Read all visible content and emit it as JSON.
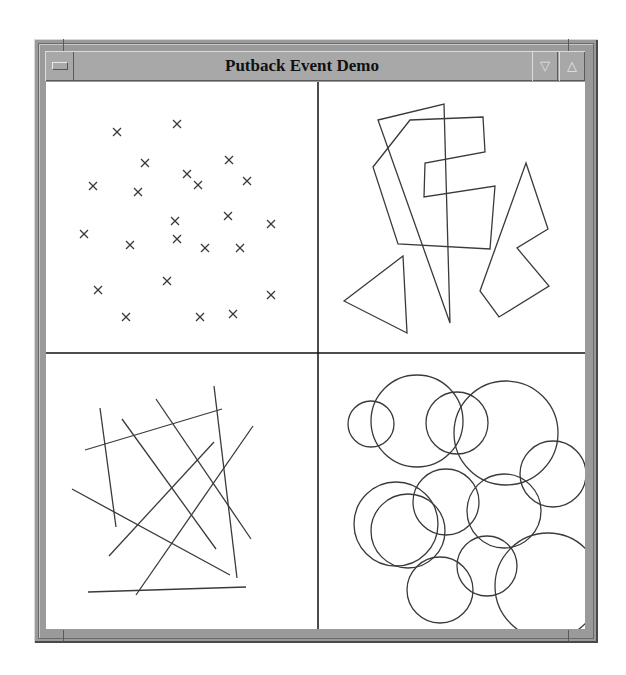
{
  "window": {
    "title": "Putback Event Demo",
    "menu_button": "window-menu",
    "minimize_glyph": "▽",
    "maximize_glyph": "△"
  },
  "panels": [
    {
      "name": "crosses",
      "marker": "x",
      "points": [
        [
          117,
          132
        ],
        [
          177,
          124
        ],
        [
          145,
          163
        ],
        [
          229,
          160
        ],
        [
          93,
          186
        ],
        [
          138,
          192
        ],
        [
          187,
          174
        ],
        [
          198,
          185
        ],
        [
          247,
          181
        ],
        [
          175,
          221
        ],
        [
          228,
          216
        ],
        [
          271,
          224
        ],
        [
          84,
          234
        ],
        [
          130,
          245
        ],
        [
          177,
          239
        ],
        [
          205,
          248
        ],
        [
          240,
          248
        ],
        [
          167,
          281
        ],
        [
          98,
          290
        ],
        [
          271,
          295
        ],
        [
          126,
          317
        ],
        [
          200,
          317
        ],
        [
          233,
          314
        ]
      ]
    },
    {
      "name": "polygons",
      "shapes": [
        [
          [
            378,
            120
          ],
          [
            444,
            104
          ],
          [
            450,
            323
          ]
        ],
        [
          [
            410,
            120
          ],
          [
            483,
            117
          ],
          [
            485,
            152
          ],
          [
            425,
            163
          ],
          [
            424,
            197
          ],
          [
            495,
            186
          ],
          [
            490,
            249
          ],
          [
            398,
            244
          ],
          [
            373,
            167
          ]
        ],
        [
          [
            344,
            301
          ],
          [
            403,
            256
          ],
          [
            407,
            333
          ]
        ],
        [
          [
            526,
            163
          ],
          [
            548,
            229
          ],
          [
            517,
            248
          ],
          [
            549,
            286
          ],
          [
            499,
            317
          ],
          [
            480,
            291
          ]
        ]
      ]
    },
    {
      "name": "lines",
      "segments": [
        [
          100,
          408,
          116,
          527
        ],
        [
          85,
          450,
          222,
          409
        ],
        [
          122,
          419,
          216,
          549
        ],
        [
          156,
          399,
          251,
          539
        ],
        [
          214,
          386,
          237,
          578
        ],
        [
          72,
          489,
          230,
          575
        ],
        [
          109,
          556,
          214,
          442
        ],
        [
          136,
          595,
          253,
          426
        ],
        [
          88,
          592,
          246,
          587
        ]
      ]
    },
    {
      "name": "circles",
      "items": [
        [
          371,
          424,
          23
        ],
        [
          417,
          421,
          46
        ],
        [
          457,
          423,
          31
        ],
        [
          506,
          433,
          52
        ],
        [
          553,
          474,
          33
        ],
        [
          446,
          502,
          33
        ],
        [
          396,
          524,
          42
        ],
        [
          408,
          531,
          37
        ],
        [
          504,
          511,
          37
        ],
        [
          487,
          566,
          30
        ],
        [
          440,
          590,
          33
        ],
        [
          548,
          586,
          53
        ]
      ]
    }
  ],
  "colors": {
    "stroke": "#3a3a3a",
    "frame": "#9a9a9a",
    "canvas": "#ffffff"
  }
}
